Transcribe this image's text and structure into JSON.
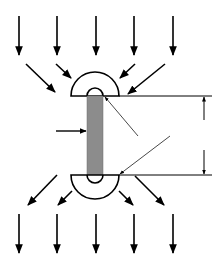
{
  "diagram": {
    "colors": {
      "stroke": "#000000",
      "rod_fill": "#8c8c8c",
      "background": "#ffffff",
      "leader": "#333333"
    },
    "top_arrows_x": [
      19,
      57,
      96,
      134,
      173
    ],
    "bottom_arrows_x": [
      19,
      57,
      96,
      134,
      173
    ],
    "labels": []
  }
}
